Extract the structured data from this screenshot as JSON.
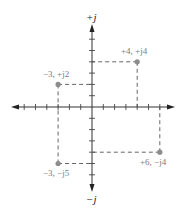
{
  "diagram": {
    "axes": {
      "imag_positive_label": "+j",
      "imag_negative_label": "−j",
      "range": {
        "real": [
          -6,
          6
        ],
        "imag": [
          -6,
          6
        ]
      }
    },
    "points": [
      {
        "label": "+4, +j4",
        "re": 4,
        "im": 4
      },
      {
        "label": "−3, +j2",
        "re": -3,
        "im": 2
      },
      {
        "label": "−3, −j5",
        "re": -3,
        "im": -5
      },
      {
        "label": "+6, −j4",
        "re": 6,
        "im": -4
      }
    ],
    "colors": {
      "axis": "#333333",
      "dashed_guides": "#555555",
      "point": "#8c8c8c",
      "point_label": "#7a7a7a"
    }
  }
}
